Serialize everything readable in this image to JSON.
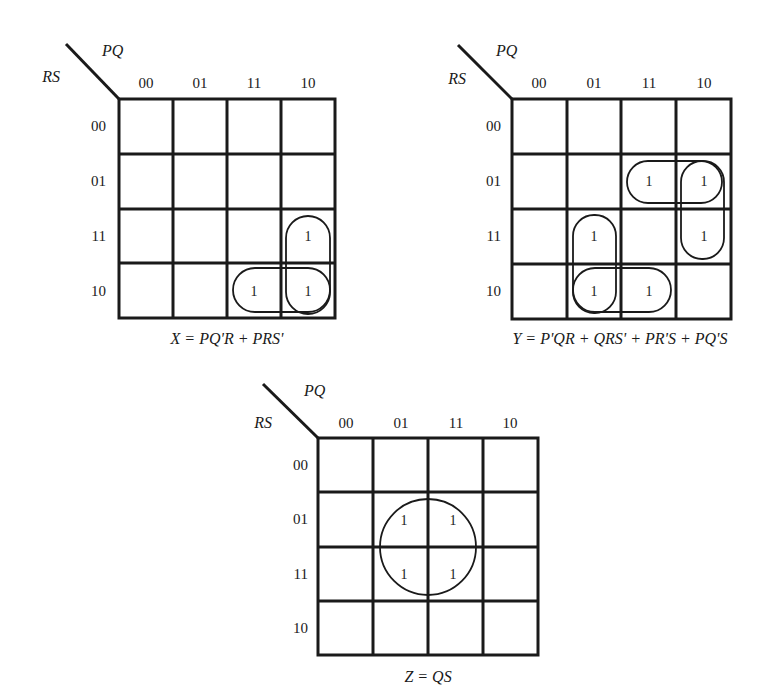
{
  "figure": {
    "row_variables": "RS",
    "column_variables": "PQ",
    "gray_code": [
      "00",
      "01",
      "11",
      "10"
    ],
    "maps": [
      {
        "id": "X",
        "equation": "X = PQ'R + PRS'",
        "rows": [
          "00",
          "01",
          "11",
          "10"
        ],
        "cols": [
          "00",
          "01",
          "11",
          "10"
        ],
        "cells": [
          [
            "",
            "",
            "",
            ""
          ],
          [
            "",
            "",
            "",
            ""
          ],
          [
            "",
            "",
            "",
            "1"
          ],
          [
            "",
            "",
            "1",
            "1"
          ]
        ],
        "groups": [
          "PQ'R (col 10, rows 11-10)",
          "PRS' (row 10, cols 11-10)"
        ]
      },
      {
        "id": "Y",
        "equation": "Y = P'QR + QRS' + PR'S + PQ'S",
        "rows": [
          "00",
          "01",
          "11",
          "10"
        ],
        "cols": [
          "00",
          "01",
          "11",
          "10"
        ],
        "cells": [
          [
            "",
            "",
            "",
            ""
          ],
          [
            "",
            "",
            "1",
            "1"
          ],
          [
            "",
            "1",
            "",
            "1"
          ],
          [
            "",
            "1",
            "1",
            ""
          ]
        ],
        "groups": [
          "P'QR (col 01, rows 11-10)",
          "QRS' (row 10, cols 01-11)",
          "PR'S (row 01, cols 11-10)",
          "PQ'S (col 10, rows 01-11)"
        ]
      },
      {
        "id": "Z",
        "equation": "Z = QS",
        "rows": [
          "00",
          "01",
          "11",
          "10"
        ],
        "cols": [
          "00",
          "01",
          "11",
          "10"
        ],
        "cells": [
          [
            "",
            "",
            "",
            ""
          ],
          [
            "",
            "1",
            "1",
            ""
          ],
          [
            "",
            "1",
            "1",
            ""
          ],
          [
            "",
            "",
            "",
            ""
          ]
        ],
        "groups": [
          "QS (cols 01-11, rows 01-11)"
        ]
      }
    ]
  },
  "map_x": {
    "row_var": "RS",
    "col_var": "PQ",
    "col0": "00",
    "col1": "01",
    "col2": "11",
    "col3": "10",
    "row0": "00",
    "row1": "01",
    "row2": "11",
    "row3": "10",
    "c_2_3": "1",
    "c_3_2": "1",
    "c_3_3": "1",
    "equation": "X = PQ'R + PRS'"
  },
  "map_y": {
    "row_var": "RS",
    "col_var": "PQ",
    "col0": "00",
    "col1": "01",
    "col2": "11",
    "col3": "10",
    "row0": "00",
    "row1": "01",
    "row2": "11",
    "row3": "10",
    "c_1_2": "1",
    "c_1_3": "1",
    "c_2_1": "1",
    "c_2_3": "1",
    "c_3_1": "1",
    "c_3_2": "1",
    "equation": "Y = P'QR + QRS' + PR'S + PQ'S"
  },
  "map_z": {
    "row_var": "RS",
    "col_var": "PQ",
    "col0": "00",
    "col1": "01",
    "col2": "11",
    "col3": "10",
    "row0": "00",
    "row1": "01",
    "row2": "11",
    "row3": "10",
    "c_1_1": "1",
    "c_1_2": "1",
    "c_2_1": "1",
    "c_2_2": "1",
    "equation": "Z = QS"
  }
}
